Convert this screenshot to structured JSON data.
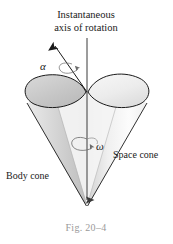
{
  "figure": {
    "title_line1": "Instantaneous",
    "title_line2": "axis of rotation",
    "alpha_label": "α",
    "omega_label": "ω",
    "body_cone_label": "Body cone",
    "space_cone_label": "Space cone",
    "caption": "Fig. 20–4",
    "colors": {
      "background": "#ffffff",
      "outline": "#1a1a1a",
      "text": "#1a1a1a",
      "caption_text": "#9a9a9a",
      "ellipse_left_fill": "#c9c9c9",
      "ellipse_right_fill": "#eeeeee",
      "cone_body_fill_light": "#fbfbfb",
      "cone_body_fill_mid": "#e3e3e3",
      "cone_body_fill_dark": "#c4c4c4",
      "axis_line": "#3a3a3a",
      "rotation_arrow": "#6a6a6a"
    },
    "icons": {
      "axis_arrow": "arrow-up-icon",
      "alpha_axis_arrow": "tilted-arrow-icon",
      "omega_spin_arrow": "rotation-arrow-icon",
      "apex_arrow": "arrow-down-icon"
    }
  }
}
